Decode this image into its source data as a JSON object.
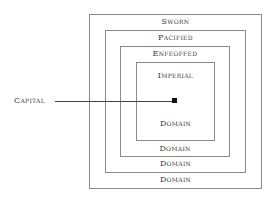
{
  "diagram": {
    "layers": [
      {
        "top": "Sworn",
        "bottom": "Domain"
      },
      {
        "top": "Pacified",
        "bottom": "Domain"
      },
      {
        "top": "Enfeoffed",
        "bottom": "Domain"
      },
      {
        "top": "Imperial",
        "bottom": "Domain"
      }
    ],
    "capital_label": "Capital"
  }
}
